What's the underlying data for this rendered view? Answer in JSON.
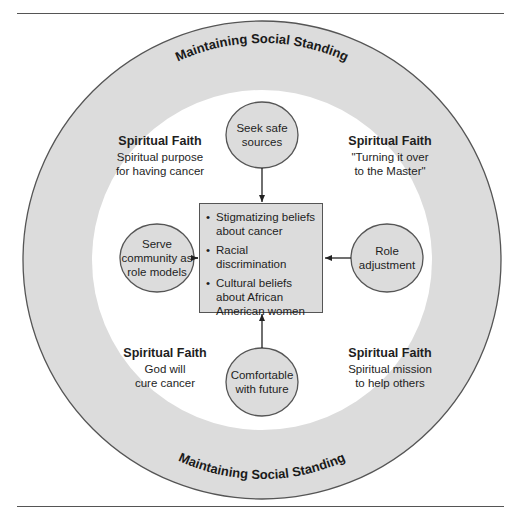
{
  "diagram": {
    "outer_ring_label_top": "Maintaining Social Standing",
    "outer_ring_label_bottom": "Maintaining Social Standing",
    "colors": {
      "ring_fill": "#dcdcdc",
      "inner_fill": "#ffffff",
      "node_fill": "#dcdcdc",
      "stroke": "#555555"
    },
    "quadrants": [
      {
        "position": "top-left",
        "heading": "Spiritual Faith",
        "line1": "Spiritual purpose",
        "line2": "for having cancer"
      },
      {
        "position": "top-right",
        "heading": "Spiritual Faith",
        "line1": "\"Turning it over",
        "line2": "to the Master\""
      },
      {
        "position": "bottom-left",
        "heading": "Spiritual Faith",
        "line1": "God will",
        "line2": "cure cancer"
      },
      {
        "position": "bottom-right",
        "heading": "Spiritual Faith",
        "line1": "Spiritual mission",
        "line2": "to help others"
      }
    ],
    "nodes": {
      "top": {
        "line1": "Seek safe",
        "line2": "sources"
      },
      "left": {
        "line1": "Serve",
        "line2": "community as",
        "line3": "role models"
      },
      "right": {
        "line1": "Role",
        "line2": "adjustment"
      },
      "bottom": {
        "line1": "Comfortable",
        "line2": "with future"
      }
    },
    "center": {
      "items": [
        "Stigmatizing beliefs about cancer",
        "Racial discrimination",
        "Cultural beliefs about African American women"
      ]
    }
  }
}
